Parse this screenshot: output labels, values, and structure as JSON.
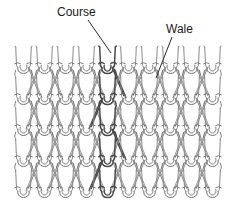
{
  "figure": {
    "type": "knitted-fabric-structure-diagram",
    "background_color": "#ffffff",
    "yarn_color": "#8a8a8a",
    "yarn_highlight_color": "#6e6e6e",
    "yarn_dark_color": "#4a4a4a",
    "label_color": "#1a1a1a",
    "leader_color": "#2a2a2a"
  },
  "labels": {
    "course": {
      "text": "Course",
      "x": 57,
      "y": 16,
      "leader": {
        "x1": 88,
        "y1": 20,
        "x2": 111,
        "y2": 53
      }
    },
    "wale": {
      "text": "Wale",
      "x": 166,
      "y": 33,
      "leader": {
        "x1": 172,
        "y1": 37,
        "x2": 156,
        "y2": 78
      }
    }
  },
  "fabric": {
    "left": 13,
    "right": 223,
    "top": 47,
    "bottom": 204,
    "wale_count": 10,
    "course_count": 5,
    "wale_pitch": 21,
    "course_pitch": 31,
    "highlighted_wale_index": 4
  }
}
